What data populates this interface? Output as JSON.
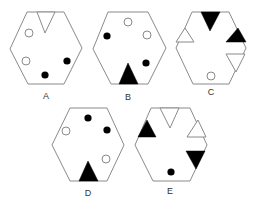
{
  "figure": {
    "type": "hexagon-pattern-options",
    "options": [
      {
        "label": "A"
      },
      {
        "label": "B"
      },
      {
        "label": "C"
      },
      {
        "label": "D"
      },
      {
        "label": "E"
      }
    ]
  },
  "colors": {
    "outline": "#8a8a8a",
    "fill_dark": "#000000",
    "background": "#ffffff",
    "label": "#333333"
  }
}
